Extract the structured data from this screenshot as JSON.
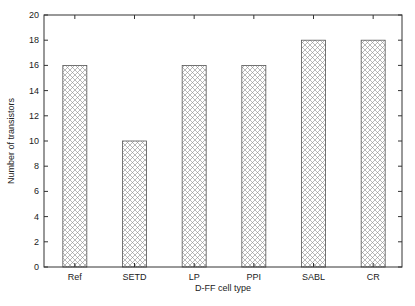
{
  "chart_data": {
    "type": "bar",
    "title": "",
    "xlabel": "D-FF cell type",
    "ylabel": "Number of transistors",
    "categories": [
      "Ref",
      "SETD",
      "LP",
      "PPI",
      "SABL",
      "CR"
    ],
    "values": [
      16,
      10,
      16,
      16,
      18,
      18
    ],
    "ylim": [
      0,
      20
    ],
    "yticks": [
      "0",
      "2",
      "4",
      "6",
      "8",
      "10",
      "12",
      "14",
      "16",
      "18",
      "20"
    ],
    "grid": false,
    "legend": null,
    "bar_fill": "crosshatch",
    "colors": {
      "bar_edge": "#555555",
      "hatch": "#888888",
      "axis": "#333333"
    }
  }
}
